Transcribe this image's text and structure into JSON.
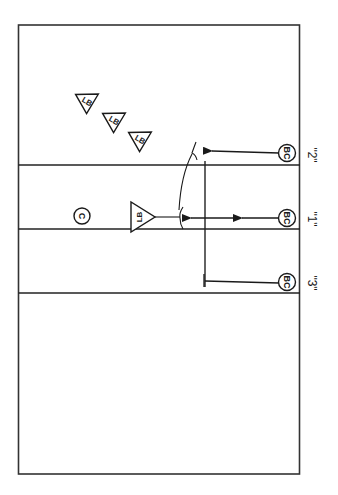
{
  "diagram": {
    "title": "",
    "orientation": "rotated-90",
    "colors": {
      "stroke": "#1a1a1a",
      "background": "#ffffff"
    },
    "lanes": [
      {
        "id": "2",
        "label": "\"2\"",
        "line_y": 165,
        "bc_y": 152
      },
      {
        "id": "1",
        "label": "\"1\"",
        "line_y": 229,
        "bc_y": 218
      },
      {
        "id": "3",
        "label": "\"3\"",
        "line_y": 293,
        "bc_y": 283
      }
    ],
    "players": {
      "ball_carriers": [
        {
          "label": "BC",
          "lane": "2"
        },
        {
          "label": "BC",
          "lane": "1"
        },
        {
          "label": "BC",
          "lane": "3"
        }
      ],
      "linebackers_group": [
        {
          "label": "LB"
        },
        {
          "label": "LB"
        },
        {
          "label": "LB"
        }
      ],
      "linebacker_front": {
        "label": "LB"
      },
      "center": {
        "label": "C"
      }
    },
    "routes": [
      {
        "from": "BC lane 2",
        "type": "arrow",
        "end": "curved-block"
      },
      {
        "from": "BC lane 1",
        "type": "double-arrow",
        "end": "curved-block"
      },
      {
        "from": "BC lane 3",
        "type": "line",
        "end": "T-block"
      }
    ]
  }
}
